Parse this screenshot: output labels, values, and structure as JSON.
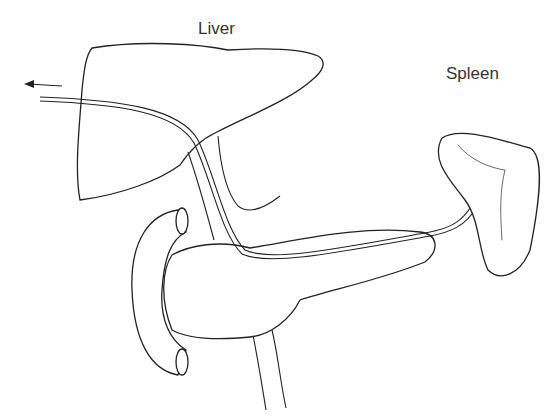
{
  "diagram": {
    "labels": {
      "liver": "Liver",
      "spleen": "Spleen"
    },
    "structures": [
      "liver",
      "spleen",
      "pancreas",
      "duodenum",
      "portal-vein",
      "catheter",
      "arrow"
    ]
  }
}
